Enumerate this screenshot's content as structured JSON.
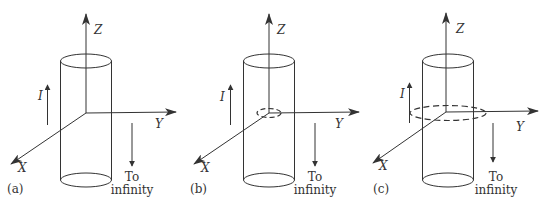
{
  "figure": {
    "colors": {
      "stroke": "#333333",
      "background": "#ffffff"
    },
    "panels": [
      {
        "id": "a",
        "label": "(a)",
        "axis_labels": {
          "z": "Z",
          "y": "Y",
          "x": "X"
        },
        "current_label": "I",
        "return_text_line1": "To",
        "return_text_line2": "infinity",
        "loop": "none"
      },
      {
        "id": "b",
        "label": "(b)",
        "axis_labels": {
          "z": "Z",
          "y": "Y",
          "x": "X"
        },
        "current_label": "I",
        "return_text_line1": "To",
        "return_text_line2": "infinity",
        "loop": "small dashed circle inside cylinder"
      },
      {
        "id": "c",
        "label": "(c)",
        "axis_labels": {
          "z": "Z",
          "y": "Y",
          "x": "X"
        },
        "current_label": "I",
        "return_text_line1": "To",
        "return_text_line2": "infinity",
        "loop": "large dashed circle outside cylinder"
      }
    ]
  }
}
